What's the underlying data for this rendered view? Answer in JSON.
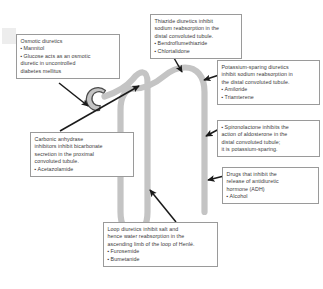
{
  "diagram": {
    "tubule_color": "#c4c4c4",
    "tubule_outline_color": "#b0b0b0",
    "glomerulus_color": "#c4c4c4",
    "glomerulus_outline_color": "#4a4a4a",
    "arrow_color": "#1a1a1a",
    "box_border_color": "#9a9a9a",
    "text_color": "#3a3a3a",
    "background_color": "#ffffff"
  },
  "callouts": {
    "osmotic": {
      "heading": "Osmotic diuretics",
      "items": [
        "Mannitol",
        "Glucose acts as an osmotic\ndiuretic in uncontrolled\ndiabetes mellitus"
      ]
    },
    "carbonic_anhydrase": {
      "heading": "Carbonic anhydrase\ninhibitors inhibit bicarbonate\nsecretion in the proximal\nconvoluted tubule.",
      "items": [
        "Acetazolamide"
      ]
    },
    "thiazide": {
      "heading": "Thiazide diuretics inhibit\nsodium reabsorption in the\ndistal convoluted tubule.",
      "items": [
        "Bendroflumethiazide",
        "Chlortalidone"
      ]
    },
    "potassium_sparing": {
      "heading": "Potassium-sparing diuretics\ninhibit sodium reabsorption in\nthe distal convoluted tubule.",
      "items": [
        "Amiloride",
        "Triamterene"
      ]
    },
    "spironolactone": {
      "heading": "",
      "items": [
        "Spironolactone inhibits the\naction of aldosterone in the\ndistal convoluted tubule;\nit is potassium-sparing."
      ]
    },
    "adh": {
      "heading": "Drugs that inhibit the\nrelease of antidiuretic\nhormone (ADH)",
      "items": [
        "Alcohol"
      ]
    },
    "loop": {
      "heading": "Loop diuretics inhibit salt and\nhence water reabsorption in the\nascending limb of the loop of Henlé.",
      "items": [
        "Furosemide",
        "Bumetanide"
      ]
    }
  }
}
